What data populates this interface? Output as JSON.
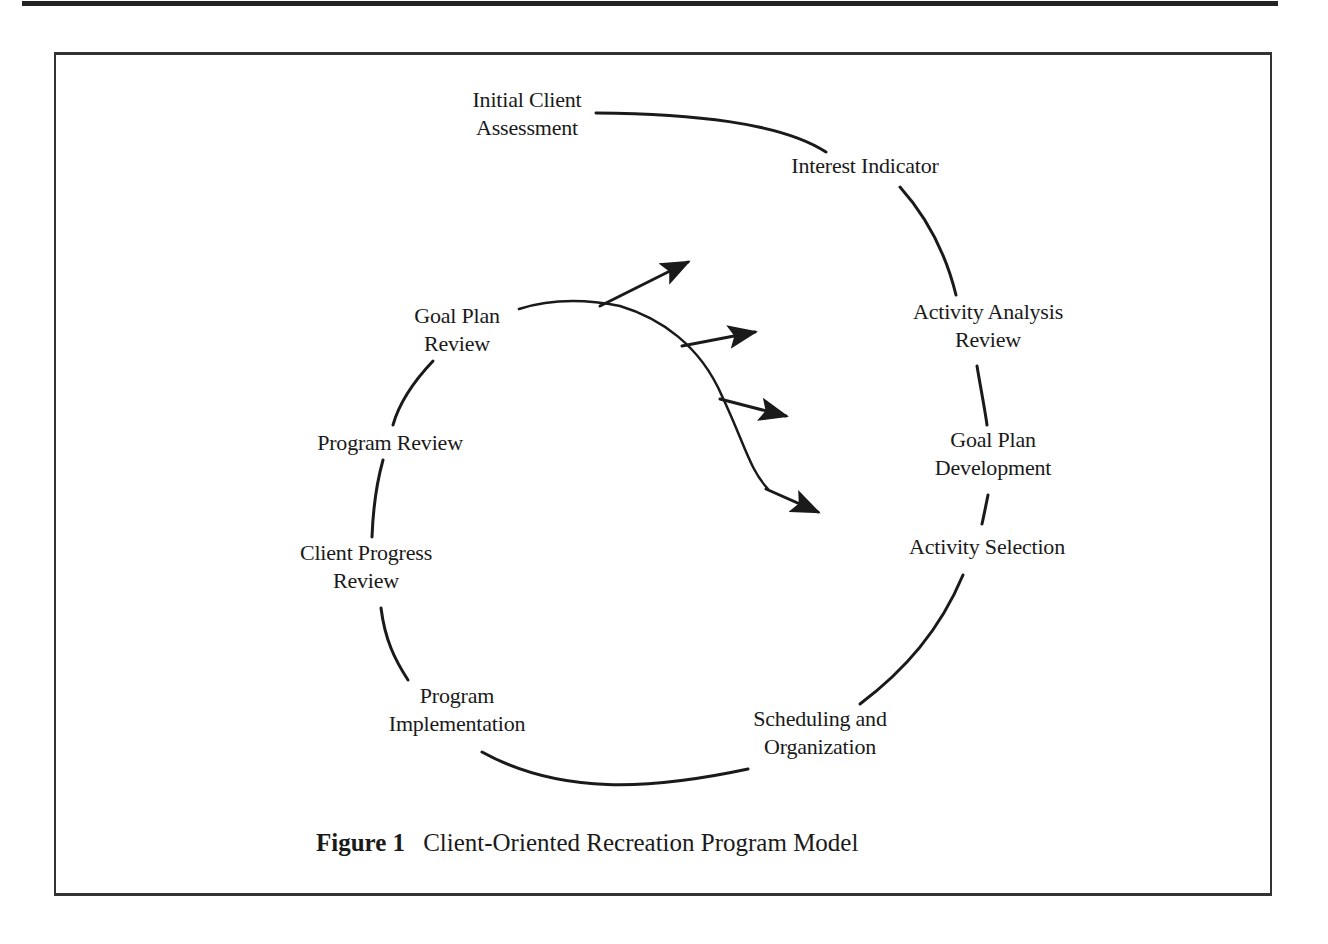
{
  "figure": {
    "number_label": "Figure 1",
    "title": "Client-Oriented Recreation Program Model"
  },
  "nodes": [
    {
      "id": "initial-client-assessment",
      "line1": "Initial Client",
      "line2": "Assessment"
    },
    {
      "id": "interest-indicator",
      "line1": "Interest Indicator",
      "line2": ""
    },
    {
      "id": "activity-analysis-review",
      "line1": "Activity Analysis",
      "line2": "Review"
    },
    {
      "id": "goal-plan-development",
      "line1": "Goal Plan",
      "line2": "Development"
    },
    {
      "id": "activity-selection",
      "line1": "Activity Selection",
      "line2": ""
    },
    {
      "id": "scheduling-and-organization",
      "line1": "Scheduling and",
      "line2": "Organization"
    },
    {
      "id": "program-implementation",
      "line1": "Program",
      "line2": "Implementation"
    },
    {
      "id": "client-progress-review",
      "line1": "Client Progress",
      "line2": "Review"
    },
    {
      "id": "program-review",
      "line1": "Program Review",
      "line2": ""
    },
    {
      "id": "goal-plan-review",
      "line1": "Goal Plan",
      "line2": "Review"
    }
  ],
  "branch_arrows": {
    "count": 4,
    "description": "Four arrows branching outward from the curve leaving Goal Plan Review"
  },
  "colors": {
    "ink": "#1a1a1a",
    "background": "#ffffff"
  }
}
